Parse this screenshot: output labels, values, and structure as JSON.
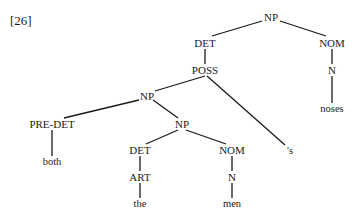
{
  "example_number": "[26]",
  "tree": {
    "nodes": [
      {
        "id": "np_root",
        "label": "NP",
        "x": 271,
        "y": 17
      },
      {
        "id": "det_top",
        "label": "DET",
        "x": 205,
        "y": 43
      },
      {
        "id": "nom_top",
        "label": "NOM",
        "x": 332,
        "y": 43
      },
      {
        "id": "poss",
        "label": "POSS",
        "x": 205,
        "y": 70
      },
      {
        "id": "n_top",
        "label": "N",
        "x": 332,
        "y": 70
      },
      {
        "id": "noses",
        "label": "noses",
        "x": 332,
        "y": 109,
        "leaf": true
      },
      {
        "id": "np_mid",
        "label": "NP",
        "x": 147,
        "y": 96
      },
      {
        "id": "apos_s",
        "label": "'s",
        "x": 290,
        "y": 151,
        "leaf": true
      },
      {
        "id": "predet",
        "label": "PRE-DET",
        "x": 52,
        "y": 124
      },
      {
        "id": "np_low",
        "label": "NP",
        "x": 182,
        "y": 124
      },
      {
        "id": "both",
        "label": "both",
        "x": 52,
        "y": 162,
        "leaf": true
      },
      {
        "id": "det_low",
        "label": "DET",
        "x": 140,
        "y": 150
      },
      {
        "id": "nom_low",
        "label": "NOM",
        "x": 232,
        "y": 150
      },
      {
        "id": "art",
        "label": "ART",
        "x": 140,
        "y": 177
      },
      {
        "id": "n_low",
        "label": "N",
        "x": 232,
        "y": 177
      },
      {
        "id": "the",
        "label": "the",
        "x": 140,
        "y": 204,
        "leaf": true
      },
      {
        "id": "men",
        "label": "men",
        "x": 232,
        "y": 204,
        "leaf": true
      }
    ],
    "edges": [
      {
        "from": [
          262,
          21
        ],
        "to": [
          212,
          36
        ]
      },
      {
        "from": [
          280,
          21
        ],
        "to": [
          326,
          36
        ]
      },
      {
        "from": [
          205,
          49
        ],
        "to": [
          205,
          64
        ]
      },
      {
        "from": [
          332,
          49
        ],
        "to": [
          332,
          64
        ]
      },
      {
        "from": [
          332,
          76
        ],
        "to": [
          332,
          103
        ]
      },
      {
        "from": [
          205,
          76
        ],
        "to": [
          155,
          91
        ]
      },
      {
        "from": [
          207,
          76
        ],
        "to": [
          285,
          145
        ]
      },
      {
        "from": [
          139,
          100
        ],
        "to": [
          64,
          118
        ]
      },
      {
        "from": [
          153,
          100
        ],
        "to": [
          178,
          118
        ]
      },
      {
        "from": [
          52,
          130
        ],
        "to": [
          52,
          156
        ]
      },
      {
        "from": [
          178,
          130
        ],
        "to": [
          146,
          144
        ]
      },
      {
        "from": [
          186,
          130
        ],
        "to": [
          226,
          144
        ]
      },
      {
        "from": [
          140,
          156
        ],
        "to": [
          140,
          171
        ]
      },
      {
        "from": [
          232,
          156
        ],
        "to": [
          232,
          171
        ]
      },
      {
        "from": [
          140,
          183
        ],
        "to": [
          140,
          198
        ]
      },
      {
        "from": [
          232,
          183
        ],
        "to": [
          232,
          198
        ]
      }
    ]
  }
}
